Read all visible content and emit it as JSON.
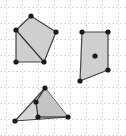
{
  "figure": {
    "width": 126,
    "height": 136,
    "background_color": "#ffffff",
    "grid": {
      "visible": true,
      "style": "dashed",
      "color": "#d8d8e0",
      "spacing": 16,
      "origin_x": 6,
      "origin_y": 7,
      "stroke_width": 1,
      "dash_pattern": "2 2"
    },
    "style": {
      "fill_color": "#cccccc",
      "fill_opacity": 0.95,
      "stroke_color": "#444444",
      "stroke_width": 1.2,
      "vertex_color": "#1a1a1a",
      "vertex_radius": 2.6,
      "inner_line_color": "#333333"
    },
    "shapes": [
      {
        "id": "shape-top-left",
        "label": "top-left-polygon",
        "type": "polygon",
        "sides": 5,
        "points": "31,16 16,30 16,62 44,62 56,32",
        "fill": "#cccccc",
        "vertices": [
          {
            "x": 31,
            "y": 16
          },
          {
            "x": 16,
            "y": 30
          },
          {
            "x": 16,
            "y": 62
          },
          {
            "x": 44,
            "y": 62
          },
          {
            "x": 56,
            "y": 32
          }
        ],
        "inner_segments": [
          {
            "x1": 16,
            "y1": 30,
            "x2": 44,
            "y2": 62
          }
        ],
        "inner_points": []
      },
      {
        "id": "shape-right",
        "label": "right-quadrilateral",
        "type": "polygon",
        "sides": 4,
        "points": "82,32 108,32 108,70 80,81",
        "fill": "#cccccc",
        "vertices": [
          {
            "x": 82,
            "y": 32
          },
          {
            "x": 108,
            "y": 32
          },
          {
            "x": 108,
            "y": 70
          },
          {
            "x": 80,
            "y": 81
          }
        ],
        "inner_segments": [],
        "inner_points": [
          {
            "x": 95,
            "y": 56,
            "label": "center-point"
          }
        ]
      },
      {
        "id": "shape-bottom",
        "label": "bottom-triangle",
        "type": "polygon",
        "sides": 3,
        "points": "45,88 15,121 68,117",
        "fill": "#d4d4d4",
        "vertices": [
          {
            "x": 45,
            "y": 88
          },
          {
            "x": 15,
            "y": 121
          },
          {
            "x": 68,
            "y": 117
          }
        ],
        "inner_segments": [
          {
            "x1": 45,
            "y1": 88,
            "x2": 36,
            "y2": 102
          },
          {
            "x1": 36,
            "y1": 102,
            "x2": 38,
            "y2": 117
          },
          {
            "x1": 38,
            "y1": 117,
            "x2": 68,
            "y2": 117
          }
        ],
        "inner_points": [
          {
            "x": 36,
            "y": 102,
            "label": "inner-vertex-upper"
          },
          {
            "x": 38,
            "y": 117,
            "label": "inner-vertex-lower"
          }
        ],
        "overlay_polygon": {
          "points": "45,88 36,102 38,117 68,117",
          "fill": "#c2c2c2"
        }
      }
    ]
  }
}
